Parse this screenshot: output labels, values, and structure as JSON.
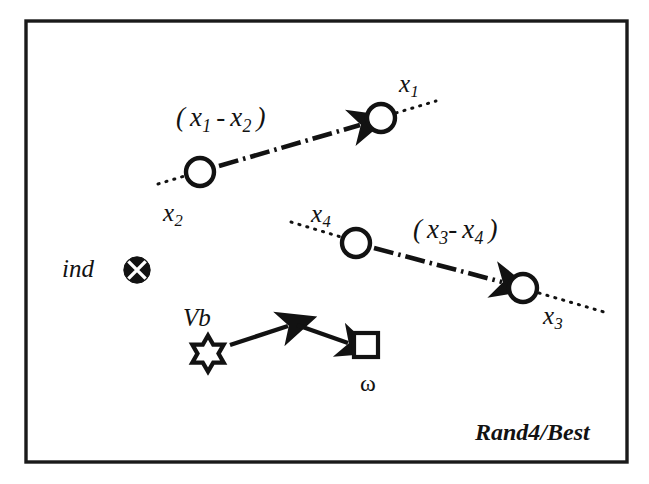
{
  "figure": {
    "title_caption": "Rand4/Best",
    "border_color": "#1a1a1a",
    "background_color": "#ffffff",
    "ink_color": "#121212"
  },
  "labels": {
    "x1": {
      "base": "x",
      "sub": "1"
    },
    "x2": {
      "base": "x",
      "sub": "2"
    },
    "x3": {
      "base": "x",
      "sub": "3"
    },
    "x4": {
      "base": "x",
      "sub": "4"
    },
    "diff_12_open": "( x",
    "diff_12_mid": " - x",
    "diff_12_close": " )",
    "ind": "ind",
    "vb": "Vb",
    "omega": "ω"
  },
  "expressions": {
    "difference_1": {
      "open": "(",
      "left": "x",
      "left_sub": "1",
      "operator": "-",
      "right": "x",
      "right_sub": "2",
      "close": ")"
    },
    "difference_2": {
      "open": "(",
      "left": "x",
      "left_sub": "3",
      "operator": "-",
      "right": "x",
      "right_sub": "4",
      "close": ")"
    }
  },
  "nodes": [
    {
      "name": "x2",
      "shape": "circle",
      "cx": 200,
      "cy": 172
    },
    {
      "name": "x1",
      "shape": "circle",
      "cx": 381,
      "cy": 118
    },
    {
      "name": "x4",
      "shape": "circle",
      "cx": 356,
      "cy": 243
    },
    {
      "name": "x3",
      "shape": "circle",
      "cx": 523,
      "cy": 288
    },
    {
      "name": "ind",
      "shape": "crossed-circle",
      "cx": 137,
      "cy": 270
    },
    {
      "name": "vb",
      "shape": "six-point-star",
      "cx": 208,
      "cy": 351
    },
    {
      "name": "omega",
      "shape": "square",
      "cx": 366,
      "cy": 345
    }
  ],
  "vectors": [
    {
      "name": "x1-minus-x2",
      "style": "dash-dot",
      "from": [
        218,
        166
      ],
      "to": [
        364,
        124
      ],
      "label": "( x1 - x2 )"
    },
    {
      "name": "x3-minus-x4",
      "style": "dash-dot",
      "from": [
        374,
        248
      ],
      "to": [
        506,
        283
      ],
      "label": "( x3 - x4 )"
    },
    {
      "name": "vb-to-mid",
      "style": "solid",
      "from": [
        230,
        344
      ],
      "to": [
        292,
        324
      ]
    },
    {
      "name": "mid-to-omega",
      "style": "solid",
      "from": [
        296,
        325
      ],
      "to": [
        352,
        345
      ]
    }
  ],
  "guides": [
    {
      "name": "x2-tail-dotted",
      "style": "dotted",
      "from": [
        160,
        183
      ],
      "to": [
        186,
        176
      ]
    },
    {
      "name": "x1-head-dotted",
      "style": "dotted",
      "from": [
        396,
        114
      ],
      "to": [
        432,
        103
      ]
    },
    {
      "name": "x4-tail-dotted",
      "style": "dotted",
      "from": [
        293,
        223
      ],
      "to": [
        340,
        237
      ]
    },
    {
      "name": "x3-head-dotted",
      "style": "dotted",
      "from": [
        538,
        293
      ],
      "to": [
        600,
        311
      ]
    }
  ]
}
